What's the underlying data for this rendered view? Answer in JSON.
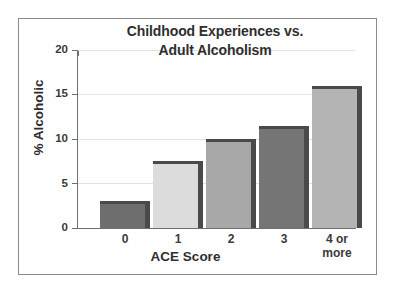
{
  "chart_data": {
    "type": "bar",
    "title": "Childhood Experiences vs. Adult Alcoholism",
    "title_lines": [
      "Childhood Experiences vs.",
      "Adult Alcoholism"
    ],
    "xlabel": "ACE Score",
    "ylabel": "% Alcoholic",
    "categories": [
      "0",
      "1",
      "2",
      "3",
      "4 or more"
    ],
    "category_lines": [
      [
        "0"
      ],
      [
        "1"
      ],
      [
        "2"
      ],
      [
        "3"
      ],
      [
        "4 or",
        "more"
      ]
    ],
    "values": [
      3.0,
      7.5,
      10.0,
      11.5,
      16.0
    ],
    "ylim": [
      0,
      20
    ],
    "yticks": [
      0,
      5,
      10,
      15,
      20
    ],
    "ytick_labels": [
      "0",
      "5",
      "10",
      "15",
      "20"
    ],
    "grid": true,
    "grid_axis": "y",
    "legend": null,
    "bar_colors": [
      "#6e6e6e",
      "#dcdcdc",
      "#a8a8a8",
      "#757575",
      "#b4b4b4"
    ],
    "bar_shadow_color": "#4a4a4a",
    "gridline_color": "#e2e2e2",
    "axis_color": "#6f6f6f",
    "frame_color": "#8a8a8a",
    "background_color": "#ffffff",
    "text_color": "#2e2e2e"
  }
}
